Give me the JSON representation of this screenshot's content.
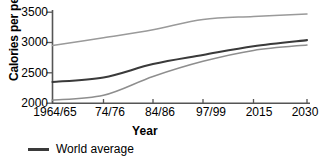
{
  "chart_data": {
    "type": "line",
    "title": "",
    "xlabel": "Year",
    "ylabel": "Calories per person",
    "categories": [
      "1964/65",
      "74/76",
      "84/86",
      "97/99",
      "2015",
      "2030"
    ],
    "ylim": [
      2000,
      3500
    ],
    "yticks": [
      2000,
      2500,
      3000,
      3500
    ],
    "grid": false,
    "legend_position": "below-left",
    "series": [
      {
        "name": "Industrial countries",
        "color": "#9a9a9a",
        "values": [
          2950,
          3080,
          3210,
          3380,
          3430,
          3470
        ]
      },
      {
        "name": "World average",
        "color": "#3a3a3a",
        "values": [
          2350,
          2425,
          2645,
          2795,
          2940,
          3040
        ]
      },
      {
        "name": "Developing countries",
        "color": "#8e8e8e",
        "values": [
          2050,
          2130,
          2440,
          2690,
          2870,
          2960
        ]
      }
    ]
  },
  "axis": {
    "y_tick_labels": [
      "3500",
      "3000",
      "2500",
      "2000"
    ],
    "x_tick_labels": [
      "1964/65",
      "74/76",
      "84/86",
      "97/99",
      "2015",
      "2030"
    ],
    "y_axis_title": "Calories per person",
    "x_axis_title": "Year"
  },
  "legend": {
    "entries": [
      {
        "label": "World average",
        "color": "#3a3a3a"
      }
    ]
  },
  "colors": {
    "axis": "#555555",
    "world_average": "#3a3a3a",
    "upper_band": "#9a9a9a",
    "lower_band": "#8e8e8e",
    "background": "#ffffff"
  }
}
